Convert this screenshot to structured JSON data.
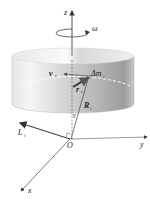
{
  "figure": {
    "labels": {
      "z": "z",
      "omega": "ω",
      "v": "v",
      "v_sub": "i",
      "dm": "Δm",
      "dm_sub": "i",
      "r": "r",
      "r_sub": "i",
      "R": "R",
      "R_sub": "i",
      "gamma": "γ",
      "L": "L",
      "L_sub": "i",
      "origin": "O",
      "y": "y",
      "x": "x"
    },
    "colors": {
      "axis": "#333333",
      "cylinder_light": "#f2f2f2",
      "cylinder_dark": "#9a9a9a",
      "dashed_orbit": "#ffffff"
    }
  }
}
